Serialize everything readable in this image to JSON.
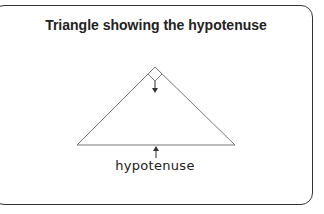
{
  "title": "Triangle showing the hypotenuse",
  "diagram": {
    "shape": "right-angled isosceles triangle",
    "right_angle_marker": "square at apex",
    "arrows": [
      {
        "from": "right-angle marker",
        "direction": "down"
      },
      {
        "from": "label",
        "direction": "up",
        "target": "base (hypotenuse)"
      }
    ],
    "label": "hypotenuse",
    "stroke_color": "#777777"
  }
}
